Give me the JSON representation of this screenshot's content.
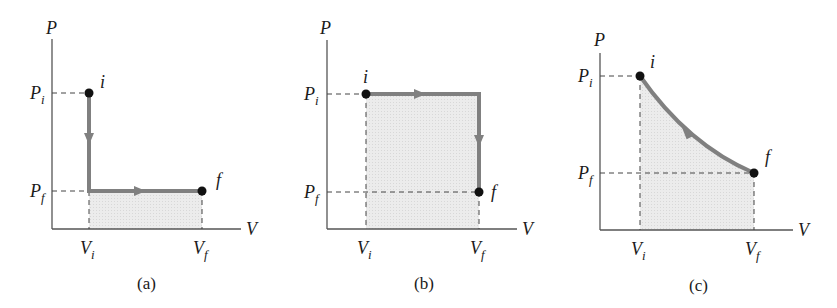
{
  "figure": {
    "panels": [
      {
        "id": "a",
        "caption": "(a)",
        "axis_y_label": "P",
        "axis_x_label": "V",
        "tick_pi": "P",
        "tick_pi_sub": "i",
        "tick_pf": "P",
        "tick_pf_sub": "f",
        "tick_vi": "V",
        "tick_vi_sub": "i",
        "tick_vf": "V",
        "tick_vf_sub": "f",
        "point_initial": "i",
        "point_final": "f",
        "path": "isochoric decrease from Pi to Pf at Vi, then isobaric expansion from Vi to Vf at Pf"
      },
      {
        "id": "b",
        "caption": "(b)",
        "axis_y_label": "P",
        "axis_x_label": "V",
        "tick_pi": "P",
        "tick_pi_sub": "i",
        "tick_pf": "P",
        "tick_pf_sub": "f",
        "tick_vi": "V",
        "tick_vi_sub": "i",
        "tick_vf": "V",
        "tick_vf_sub": "f",
        "point_initial": "i",
        "point_final": "f",
        "path": "isobaric expansion from Vi to Vf at Pi, then isochoric decrease from Pi to Pf at Vf"
      },
      {
        "id": "c",
        "caption": "(c)",
        "axis_y_label": "P",
        "axis_x_label": "V",
        "tick_pi": "P",
        "tick_pi_sub": "i",
        "tick_pf": "P",
        "tick_pf_sub": "f",
        "tick_vi": "V",
        "tick_vi_sub": "i",
        "tick_vf": "V",
        "tick_vf_sub": "f",
        "point_initial": "i",
        "point_final": "f",
        "path": "smooth curve from (Vi,Pi) to (Vf,Pf)"
      }
    ],
    "colors": {
      "path": "#808080",
      "fill": "#e6e6e6",
      "axis": "#555555",
      "dashed": "#444444",
      "point": "#111111"
    }
  }
}
